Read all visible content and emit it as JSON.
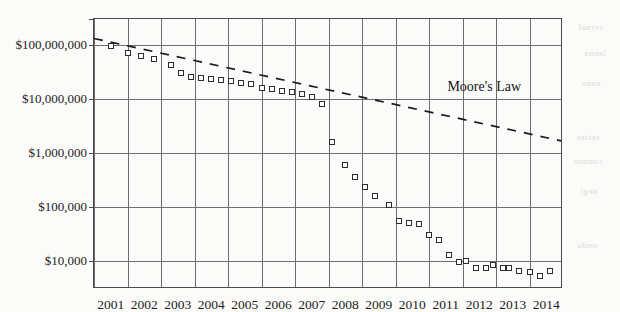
{
  "chart_data": {
    "type": "scatter",
    "title": "",
    "xlabel": "",
    "ylabel": "",
    "yscale": "log",
    "grid": true,
    "legend": "none",
    "xlim": [
      2001,
      2015
    ],
    "ylim": [
      3000,
      300000000
    ],
    "x_ticks": [
      "2001",
      "2002",
      "2003",
      "2004",
      "2005",
      "2006",
      "2007",
      "2008",
      "2009",
      "2010",
      "2011",
      "2012",
      "2013",
      "2014"
    ],
    "x_tick_values": [
      2001,
      2002,
      2003,
      2004,
      2005,
      2006,
      2007,
      2008,
      2009,
      2010,
      2011,
      2012,
      2013,
      2014
    ],
    "y_ticks": [
      "$10,000",
      "$100,000",
      "$1,000,000",
      "$10,000,000",
      "$100,000,000"
    ],
    "y_tick_values": [
      10000,
      100000,
      1000000,
      10000000,
      100000000
    ],
    "series": [
      {
        "name": "Cost per genome",
        "marker": "open-square",
        "points": [
          {
            "x": 2001.5,
            "y": 95000000
          },
          {
            "x": 2002.0,
            "y": 70000000
          },
          {
            "x": 2002.4,
            "y": 61000000
          },
          {
            "x": 2002.8,
            "y": 55000000
          },
          {
            "x": 2003.3,
            "y": 43000000
          },
          {
            "x": 2003.6,
            "y": 30000000
          },
          {
            "x": 2003.9,
            "y": 25000000
          },
          {
            "x": 2004.2,
            "y": 24000000
          },
          {
            "x": 2004.5,
            "y": 23000000
          },
          {
            "x": 2004.8,
            "y": 22000000
          },
          {
            "x": 2005.1,
            "y": 21000000
          },
          {
            "x": 2005.4,
            "y": 20000000
          },
          {
            "x": 2005.7,
            "y": 19000000
          },
          {
            "x": 2006.0,
            "y": 16000000
          },
          {
            "x": 2006.3,
            "y": 15000000
          },
          {
            "x": 2006.6,
            "y": 14000000
          },
          {
            "x": 2006.9,
            "y": 13500000
          },
          {
            "x": 2007.2,
            "y": 12500000
          },
          {
            "x": 2007.5,
            "y": 11000000
          },
          {
            "x": 2007.8,
            "y": 8000000
          },
          {
            "x": 2008.1,
            "y": 1600000
          },
          {
            "x": 2008.5,
            "y": 600000
          },
          {
            "x": 2008.8,
            "y": 350000
          },
          {
            "x": 2009.1,
            "y": 230000
          },
          {
            "x": 2009.4,
            "y": 160000
          },
          {
            "x": 2009.8,
            "y": 110000
          },
          {
            "x": 2010.1,
            "y": 55000
          },
          {
            "x": 2010.4,
            "y": 50000
          },
          {
            "x": 2010.7,
            "y": 48000
          },
          {
            "x": 2011.0,
            "y": 30000
          },
          {
            "x": 2011.3,
            "y": 24000
          },
          {
            "x": 2011.6,
            "y": 13000
          },
          {
            "x": 2011.9,
            "y": 9500
          },
          {
            "x": 2012.1,
            "y": 9800
          },
          {
            "x": 2012.4,
            "y": 7500
          },
          {
            "x": 2012.7,
            "y": 7300
          },
          {
            "x": 2012.9,
            "y": 8200
          },
          {
            "x": 2013.2,
            "y": 7400
          },
          {
            "x": 2013.4,
            "y": 7300
          },
          {
            "x": 2013.7,
            "y": 6600
          },
          {
            "x": 2014.0,
            "y": 6200
          },
          {
            "x": 2014.3,
            "y": 5200
          },
          {
            "x": 2014.6,
            "y": 6400
          }
        ]
      }
    ],
    "annotations": [
      {
        "name": "moores-law-line",
        "label": "Moore's Law",
        "style": "dashed",
        "from": {
          "x": 2001.0,
          "y": 130000000
        },
        "to": {
          "x": 2015.0,
          "y": 1600000
        }
      }
    ]
  },
  "bleed_text": [
    {
      "text": "vernal",
      "x": 578,
      "y": 22
    },
    {
      "text": "lanna",
      "x": 584,
      "y": 48
    },
    {
      "text": "anno",
      "x": 581,
      "y": 78
    },
    {
      "text": "sertes",
      "x": 576,
      "y": 132
    },
    {
      "text": "commo",
      "x": 573,
      "y": 156
    },
    {
      "text": "negi",
      "x": 580,
      "y": 186
    },
    {
      "text": "ondu",
      "x": 577,
      "y": 240
    }
  ]
}
